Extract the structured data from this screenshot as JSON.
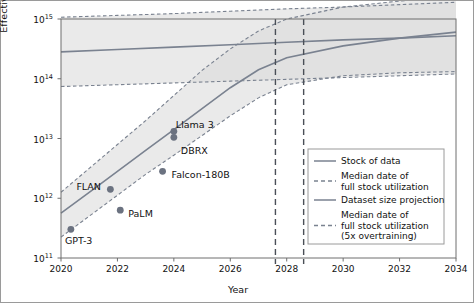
{
  "chart_data": {
    "type": "line",
    "title": "",
    "xlabel": "Year",
    "ylabel": "Effective stock (number of tokens)",
    "xlim": [
      2020,
      2034
    ],
    "ylim_log10": [
      11,
      15
    ],
    "xticks": [
      "2020",
      "2022",
      "2024",
      "2026",
      "2028",
      "2030",
      "2032",
      "2034"
    ],
    "yticks": [
      "10^11",
      "10^12",
      "10^13",
      "10^14",
      "10^15"
    ],
    "ytick_base": "10",
    "ytick_exponents": [
      "11",
      "12",
      "13",
      "14",
      "15"
    ],
    "grid": false,
    "legend_position": "bottom-right",
    "series": [
      {
        "name": "Stock of data",
        "style": "solid",
        "color": "#7a8290",
        "x": [
          2020,
          2022,
          2024,
          2026,
          2028,
          2030,
          2032,
          2034
        ],
        "y_log10": [
          14.45,
          14.49,
          14.53,
          14.57,
          14.61,
          14.65,
          14.68,
          14.72
        ]
      },
      {
        "name": "Stock of data (upper bound)",
        "style": "dashed",
        "color": "#7a8290",
        "x": [
          2020,
          2022,
          2024,
          2026,
          2028,
          2030,
          2032,
          2034
        ],
        "y_log10": [
          15.03,
          15.06,
          15.09,
          15.13,
          15.17,
          15.2,
          15.24,
          15.28
        ]
      },
      {
        "name": "Stock of data (lower bound)",
        "style": "dashed",
        "color": "#7a8290",
        "x": [
          2020,
          2022,
          2024,
          2026,
          2028,
          2030,
          2032,
          2034
        ],
        "y_log10": [
          13.87,
          13.9,
          13.93,
          13.96,
          13.99,
          14.02,
          14.05,
          14.08
        ]
      },
      {
        "name": "Dataset size projection",
        "style": "solid",
        "color": "#7a8290",
        "x": [
          2020,
          2021,
          2022,
          2023,
          2024,
          2025,
          2026,
          2027,
          2028,
          2030,
          2032,
          2034
        ],
        "y_log10": [
          11.75,
          12.1,
          12.45,
          12.8,
          13.15,
          13.5,
          13.85,
          14.15,
          14.35,
          14.55,
          14.68,
          14.78
        ]
      },
      {
        "name": "Dataset size projection (upper bound)",
        "style": "dashed",
        "color": "#7a8290",
        "x": [
          2020,
          2021,
          2022,
          2023,
          2024,
          2025,
          2026,
          2027,
          2028,
          2030,
          2032,
          2034
        ],
        "y_log10": [
          12.1,
          12.5,
          12.9,
          13.3,
          13.72,
          14.14,
          14.5,
          14.8,
          15.0,
          15.2,
          15.3,
          15.38
        ]
      },
      {
        "name": "Dataset size projection (lower bound)",
        "style": "dashed",
        "color": "#7a8290",
        "x": [
          2020,
          2021,
          2022,
          2023,
          2024,
          2025,
          2026,
          2027,
          2028,
          2030,
          2032,
          2034
        ],
        "y_log10": [
          11.35,
          11.7,
          12.05,
          12.4,
          12.72,
          13.05,
          13.38,
          13.68,
          13.9,
          14.05,
          14.1,
          14.12
        ]
      }
    ],
    "vertical_lines": [
      {
        "name": "Median date of full stock utilization",
        "x": 2028.6,
        "style": "dashed"
      },
      {
        "name": "Median date of full stock utilization (5x overtraining)",
        "x": 2027.6,
        "style": "dashed"
      }
    ],
    "points": [
      {
        "label": "GPT-3",
        "x": 2020.35,
        "y_log10": 11.48,
        "label_dx": -6,
        "label_dy": 12
      },
      {
        "label": "FLAN",
        "x": 2021.75,
        "y_log10": 12.15,
        "label_dx": -34,
        "label_dy": -2
      },
      {
        "label": "PaLM",
        "x": 2022.1,
        "y_log10": 11.8,
        "label_dx": 8,
        "label_dy": 4
      },
      {
        "label": "Falcon-180B",
        "x": 2023.6,
        "y_log10": 12.45,
        "label_dx": 9,
        "label_dy": 4
      },
      {
        "label": "DBRX",
        "x": 2024.0,
        "y_log10": 13.02,
        "label_dx": 7,
        "label_dy": 14
      },
      {
        "label": "Llama 3",
        "x": 2024.0,
        "y_log10": 13.12,
        "label_dx": 2,
        "label_dy": -6
      }
    ],
    "point_color": "#6b7280",
    "band_color": "#d9d9d9"
  },
  "legend": {
    "items": [
      {
        "label": "Stock of data",
        "style": "solid"
      },
      {
        "label": "Median date of\nfull stock utilization",
        "style": "dashed"
      },
      {
        "label": "Dataset size projection",
        "style": "solid"
      },
      {
        "label": "Median date of\nfull stock utilization\n(5x overtraining)",
        "style": "dashed"
      }
    ],
    "item1_line1": "Stock of data",
    "item2_line1": "Median date of",
    "item2_line2": "full stock utilization",
    "item3_line1": "Dataset size projection",
    "item4_line1": "Median date of",
    "item4_line2": "full stock utilization",
    "item4_line3": "(5x overtraining)"
  }
}
